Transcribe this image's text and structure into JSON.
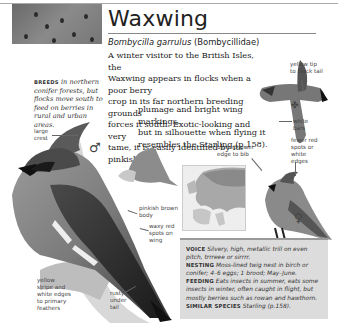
{
  "header": {
    "title": "Waxwing",
    "latin_name": "Bombycilla garrulus",
    "family": "(Bombycillidae)"
  },
  "intro": {
    "lines_wide": [
      "A winter visitor to the British Isles, the",
      "Waxwing appears in flocks when a poor berry",
      "crop in its far northern breeding grounds",
      "forces it south. Exotic-looking and very",
      "tame, it is easily identified by its pinkish"
    ],
    "lines_narrow": [
      "plumage and bright wing markings,",
      "but in silhouette when flying it",
      "resembles the Starling (p.158)."
    ]
  },
  "breeds": {
    "label": "BREEDS",
    "text": "in northern conifer forests, but flocks move south to feed on berries in rural and urban areas."
  },
  "annotations": {
    "large_crest": "large crest",
    "pinkish_brown_body": "pinkish brown body",
    "waxy_red_spots": "waxy red spots on wing",
    "yellow_stripe": "yellow stripe and white edges to primary feathers",
    "rusty_under_tail": "rusty under tail",
    "yellow_tip": "yellow tip to black tail",
    "white_bars": "white bars",
    "fewer_red_spots": "fewer red spots or white edges",
    "blurred_lower_edge": "blurred lower edge to bib"
  },
  "symbols": {
    "male": "♂",
    "female": "♀"
  },
  "info": {
    "voice_label": "VOICE",
    "voice_text": "Silvery, high, metallic trill on even pitch, trrreee or sirrrr.",
    "nesting_label": "NESTING",
    "nesting_text": "Moss-lined twig nest in birch or conifer; 4–6 eggs; 1 brood; May–June.",
    "feeding_label": "FEEDING",
    "feeding_text": "Eats insects in summer, eats some insects in winter, often caught in flight, but mostly berries such as rowan and hawthorn.",
    "similar_label": "SIMILAR SPECIES",
    "similar_text": "Starling (p.158)."
  }
}
